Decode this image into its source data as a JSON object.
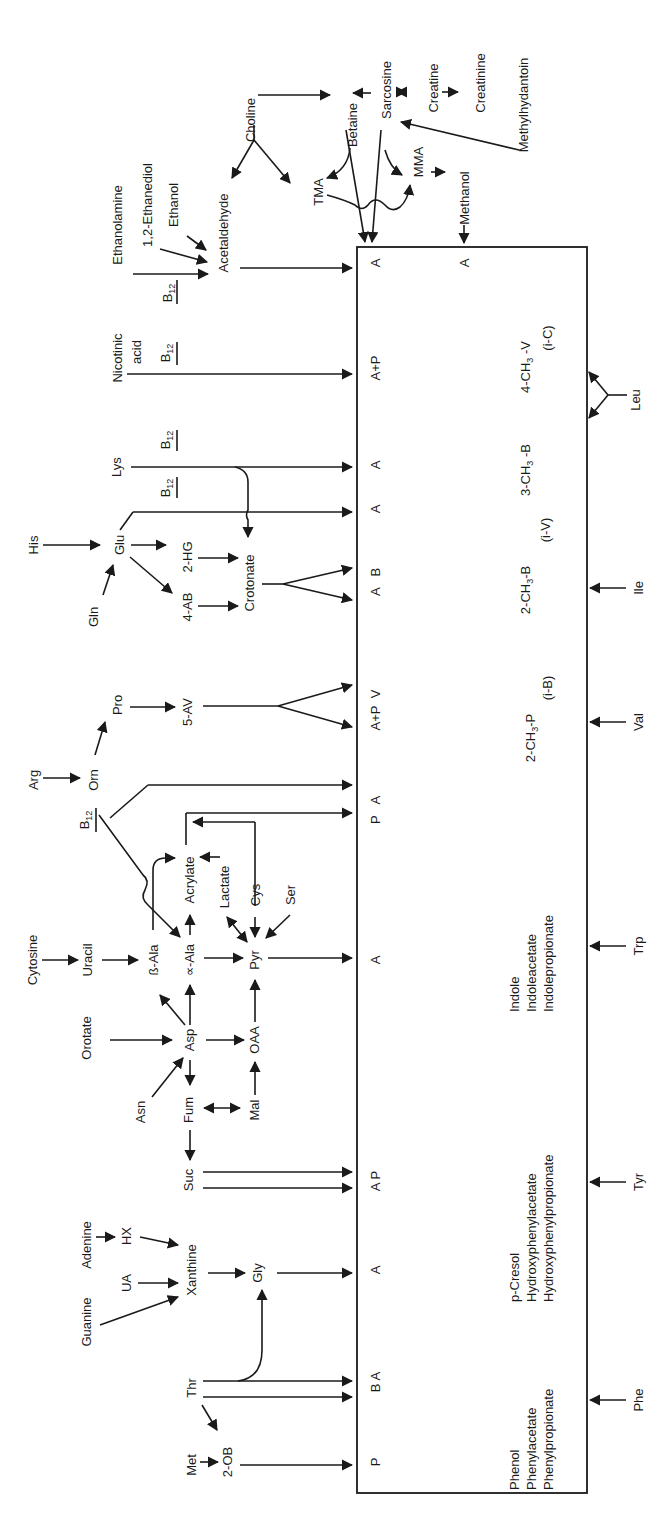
{
  "diagram": {
    "box_products_top": [
      {
        "id": "p1",
        "label": "P",
        "y": 1460
      },
      {
        "id": "p2",
        "label": "B A",
        "y": 1355
      },
      {
        "id": "p3",
        "label": "A",
        "y": 1271
      },
      {
        "id": "p4",
        "label": "A P",
        "y": 1168
      },
      {
        "id": "p5",
        "label": "A",
        "y": 963
      },
      {
        "id": "p6",
        "label": "P  A",
        "y": 812
      },
      {
        "id": "p7",
        "label": "A+P  V",
        "y": 735
      },
      {
        "id": "p8",
        "label": "A  B",
        "y": 598
      },
      {
        "id": "p9",
        "label": "A",
        "y": 510
      },
      {
        "id": "p10",
        "label": "A",
        "y": 464
      },
      {
        "id": "p11",
        "label": "A+P",
        "y": 365
      },
      {
        "id": "p12",
        "label": "A",
        "y": 263
      },
      {
        "id": "p13",
        "label": "A",
        "y": 263
      }
    ],
    "box_interior_labels": {
      "phenyl": [
        "Phenol",
        "Phenylacetate",
        "Phenylpropionate"
      ],
      "hydroxyphenyl": [
        "p-Cresol",
        "Hydroxyphenylacetate",
        "Hydroxyphenylpropionate"
      ],
      "indole": [
        "Indole",
        "Indoleacetate",
        "Indolepropionate"
      ],
      "val_product": [
        "2-CH3-P",
        "(i-B)"
      ],
      "ile_product": [
        "2-CH3-B",
        "(i-V)"
      ],
      "mb_product": [
        "3-CH3-B"
      ],
      "leu_product": [
        "4-CH3-V",
        "(i-C)"
      ]
    },
    "right_inputs": [
      "Phe",
      "Tyr",
      "Trp",
      "Val",
      "Ile",
      "Leu"
    ],
    "substrates": {
      "Met": "Met",
      "2-OB": "2-OB",
      "Thr": "Thr",
      "Gly": "Gly",
      "Guanine": "Guanine",
      "UA": "UA",
      "Xanthine": "Xanthine",
      "Adenine": "Adenine",
      "HX": "HX",
      "Suc": "Suc",
      "Fum": "Fum",
      "Mal": "Mal",
      "Asn": "Asn",
      "Asp": "Asp",
      "OAA": "OAA",
      "Orotate": "Orotate",
      "Cytosine": "Cytosine",
      "Uracil": "Uracil",
      "bAla": "ß-Ala",
      "aAla": "∝-Ala",
      "Pyr": "Pyr",
      "Acrylate": "Acrylate",
      "Lactate": "Lactate",
      "Cys": "Cys",
      "Ser": "Ser",
      "B12": "B12",
      "Arg": "Arg",
      "Orn": "Orn",
      "Pro": "Pro",
      "5-AV": "5-AV",
      "Gln": "Gln",
      "His": "His",
      "Glu": "Glu",
      "4-AB": "4-AB",
      "2-HG": "2-HG",
      "Crotonate": "Crotonate",
      "Lys": "Lys",
      "Nicotinic": "Nicotinic",
      "acid": "acid",
      "Ethanolamine": "Ethanolamine",
      "Ethanediol": "1,2-Ethanediol",
      "Ethanol": "Ethanol",
      "Acetaldehyde": "Acetaldehyde",
      "Choline": "Choline",
      "TMA": "TMA",
      "Betaine": "Betaine",
      "Sarcosine": "Sarcosine",
      "MMA": "MMA",
      "Methanol": "Methanol",
      "Creatine": "Creatine",
      "Creatinine": "Creatinine",
      "Methylhydantoin": "Methylhydantoin"
    },
    "colors": {
      "ink": "#1a1a1a",
      "background": "#ffffff"
    }
  }
}
